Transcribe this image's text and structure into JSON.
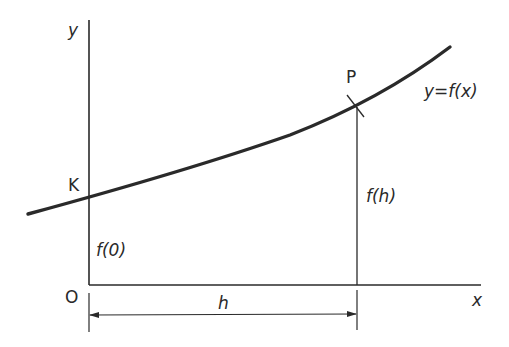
{
  "diagram": {
    "type": "function-graph",
    "axes": {
      "x_label": "x",
      "y_label": "y",
      "origin_label": "O"
    },
    "curve": {
      "label": "y=f(x)",
      "points": {
        "K": "K",
        "P": "P"
      }
    },
    "segments": {
      "f0_label": "f(0)",
      "fh_label": "f(h)",
      "h_label": "h"
    },
    "colors": {
      "ink": "#2a2a2a",
      "background": "#ffffff"
    }
  }
}
